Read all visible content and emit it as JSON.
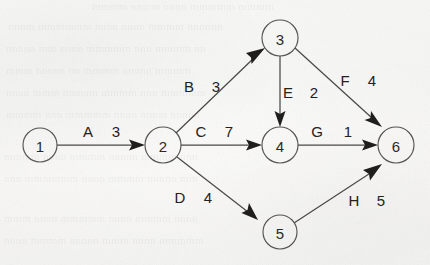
{
  "figure": {
    "kind": "weighted-directed-graph",
    "background_color": "#f5f5f3",
    "ink_color": "#232220",
    "node_stroke_color": "#55544f"
  },
  "nodes": [
    {
      "id": "n1",
      "label": "1",
      "cx": 40,
      "cy": 145,
      "r": 17
    },
    {
      "id": "n2",
      "label": "2",
      "cx": 163,
      "cy": 145,
      "r": 18
    },
    {
      "id": "n3",
      "label": "3",
      "cx": 280,
      "cy": 38,
      "r": 18
    },
    {
      "id": "n4",
      "label": "4",
      "cx": 280,
      "cy": 145,
      "r": 18
    },
    {
      "id": "n5",
      "label": "5",
      "cx": 280,
      "cy": 232,
      "r": 17
    },
    {
      "id": "n6",
      "label": "6",
      "cx": 396,
      "cy": 145,
      "r": 18
    }
  ],
  "edges": [
    {
      "id": "eA",
      "name": "A",
      "weight": "3",
      "from": "n1",
      "to": "n2",
      "name_x": 88,
      "name_y": 131,
      "weight_x": 116,
      "weight_y": 131
    },
    {
      "id": "eB",
      "name": "B",
      "weight": "3",
      "from": "n2",
      "to": "n3",
      "name_x": 189,
      "name_y": 86,
      "weight_x": 216,
      "weight_y": 86
    },
    {
      "id": "eC",
      "name": "C",
      "weight": "7",
      "from": "n2",
      "to": "n4",
      "name_x": 201,
      "name_y": 131,
      "weight_x": 229,
      "weight_y": 131
    },
    {
      "id": "eD",
      "name": "D",
      "weight": "4",
      "from": "n2",
      "to": "n5",
      "name_x": 180,
      "name_y": 197,
      "weight_x": 208,
      "weight_y": 197
    },
    {
      "id": "eE",
      "name": "E",
      "weight": "2",
      "from": "n3",
      "to": "n4",
      "name_x": 288,
      "name_y": 92,
      "weight_x": 314,
      "weight_y": 92
    },
    {
      "id": "eF",
      "name": "F",
      "weight": "4",
      "from": "n3",
      "to": "n6",
      "name_x": 345,
      "name_y": 80,
      "weight_x": 372,
      "weight_y": 80
    },
    {
      "id": "eG",
      "name": "G",
      "weight": "1",
      "from": "n4",
      "to": "n6",
      "name_x": 317,
      "name_y": 131,
      "weight_x": 348,
      "weight_y": 131
    },
    {
      "id": "eH",
      "name": "H",
      "weight": "5",
      "from": "n5",
      "to": "n6",
      "name_x": 354,
      "name_y": 200,
      "weight_x": 381,
      "weight_y": 200
    }
  ]
}
